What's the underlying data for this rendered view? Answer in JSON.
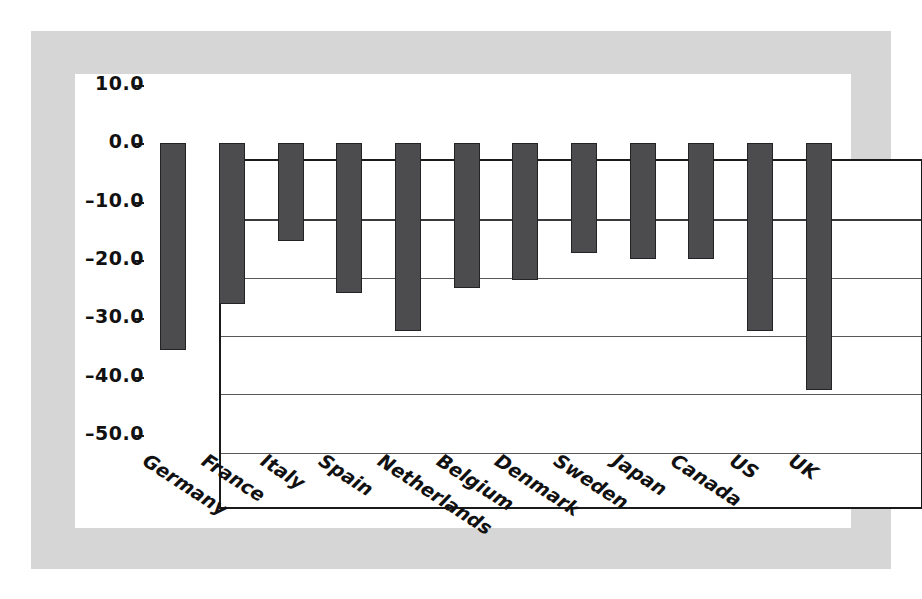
{
  "chart_data": {
    "type": "bar",
    "title": "",
    "subtitle": "",
    "xlabel": "",
    "ylabel": "",
    "categories": [
      "Germany",
      "France",
      "Italy",
      "Spain",
      "Netherlands",
      "Belgium",
      "Denmark",
      "Sweden",
      "Japan",
      "Canada",
      "US",
      "UK"
    ],
    "values": [
      -35.5,
      -27.5,
      -16.8,
      -25.6,
      -32.2,
      -24.8,
      -23.5,
      -18.8,
      -19.8,
      -19.9,
      -32.2,
      -42.3
    ],
    "series": [
      {
        "name": "",
        "values": [
          -35.5,
          -27.5,
          -16.8,
          -25.6,
          -32.2,
          -24.8,
          -23.5,
          -18.8,
          -19.8,
          -19.9,
          -32.2,
          -42.3
        ]
      }
    ],
    "ylim": [
      -50.0,
      10.0
    ],
    "ytick_values": [
      10.0,
      0.0,
      -10.0,
      -20.0,
      -30.0,
      -40.0,
      -50.0
    ],
    "ytick_labels": [
      "10.0",
      "0.0",
      "–10.0",
      "–20.0",
      "–30.0",
      "–40.0",
      "–50.0"
    ],
    "grid": true,
    "gridlines_at": [
      0.0,
      -10.0,
      -20.0,
      -30.0,
      -40.0
    ],
    "legend": null,
    "legend_position": "none",
    "annotations": [],
    "xlabel_rotation": 33,
    "bar_color": "#4c4c4e",
    "bar_edge_color": "#232325",
    "axis_color": "#1a1a1a",
    "gridline_color": "#58585a",
    "plot_background": "#ffffff",
    "panel_background": "#ffffff",
    "mount_background": "#d6d6d6",
    "page_background": "#ffffff"
  }
}
